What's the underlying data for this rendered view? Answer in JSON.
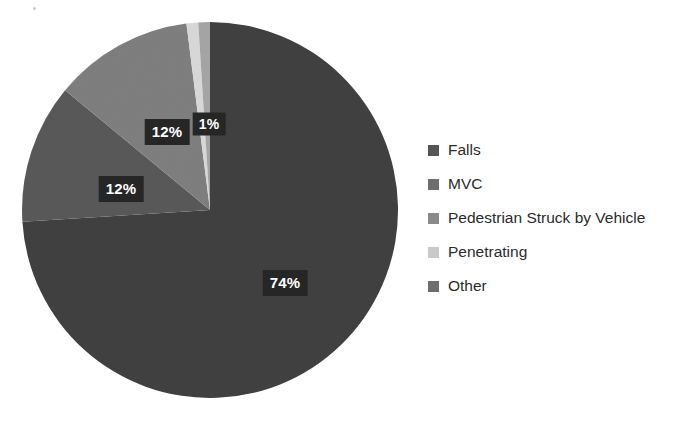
{
  "chart_data": {
    "type": "pie",
    "title": "",
    "subtitle": "",
    "xlabel": "",
    "ylabel": "",
    "grid": false,
    "legend_position": "right",
    "categories": [
      "Falls",
      "MVC",
      "Pedestrian Struck by Vehicle",
      "Penetrating",
      "Other"
    ],
    "values": [
      74,
      12,
      12,
      1,
      1
    ],
    "value_unit": "%",
    "slices": [
      {
        "label": "Falls",
        "value": 74,
        "display": "74%",
        "color": "#404040"
      },
      {
        "label": "MVC",
        "value": 12,
        "display": "12%",
        "color": "#595959"
      },
      {
        "label": "Pedestrian Struck by Vehicle",
        "value": 12,
        "display": "12%",
        "color": "#7f7f7f"
      },
      {
        "label": "Penetrating",
        "value": 1,
        "display": "1%",
        "color": "#d9d9d9"
      },
      {
        "label": "Other",
        "value": 1,
        "display": "",
        "color": "#a6a6a6"
      }
    ],
    "data_labels": [
      {
        "name": "falls",
        "display": "74%"
      },
      {
        "name": "mvc",
        "display": "12%"
      },
      {
        "name": "pedestrian",
        "display": "12%"
      },
      {
        "name": "penetrating",
        "display": "1%"
      }
    ]
  },
  "legend": {
    "items": [
      {
        "label": "Falls",
        "color": "#545454"
      },
      {
        "label": "MVC",
        "color": "#6e6e6e"
      },
      {
        "label": "Pedestrian Struck by Vehicle",
        "color": "#8a8a8a"
      },
      {
        "label": "Penetrating",
        "color": "#c9c9c9"
      },
      {
        "label": "Other",
        "color": "#6e6e6e"
      }
    ]
  },
  "colors": {
    "background": "#ffffff",
    "label_text": "#ffffff",
    "label_box": "#262626",
    "legend_text": "#2b2b2b",
    "falls": "#404040",
    "mvc": "#595959",
    "pedestrian": "#7f7f7f",
    "penetrating": "#d9d9d9",
    "other": "#a6a6a6"
  }
}
